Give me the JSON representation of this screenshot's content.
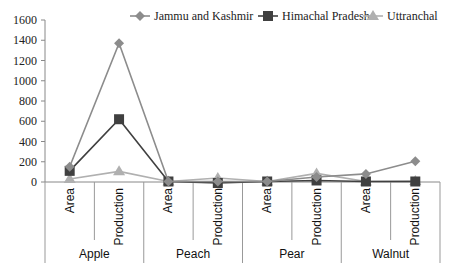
{
  "chart_data": {
    "type": "line",
    "title": "",
    "xlabel": "",
    "ylabel": "",
    "ylim": [
      0,
      1600
    ],
    "yticks": [
      0,
      200,
      400,
      600,
      800,
      1000,
      1200,
      1400,
      1600
    ],
    "grid": false,
    "legend_position": "top-right",
    "groups": [
      "Apple",
      "Peach",
      "Pear",
      "Walnut"
    ],
    "categories": [
      "Area",
      "Production",
      "Area",
      "Production",
      "Area",
      "Production",
      "Area",
      "Production"
    ],
    "series": [
      {
        "name": "Jammu and Kashmir",
        "marker": "diamond",
        "color": "#8c8c8c",
        "values": [
          150,
          1370,
          5,
          5,
          5,
          50,
          80,
          205
        ]
      },
      {
        "name": "Himachal Pradesh",
        "marker": "square",
        "color": "#404040",
        "values": [
          110,
          620,
          5,
          -10,
          5,
          15,
          5,
          5
        ]
      },
      {
        "name": "Uttranchal",
        "marker": "triangle",
        "color": "#b0b0b0",
        "values": [
          30,
          105,
          5,
          40,
          5,
          85,
          5,
          10
        ]
      }
    ]
  }
}
